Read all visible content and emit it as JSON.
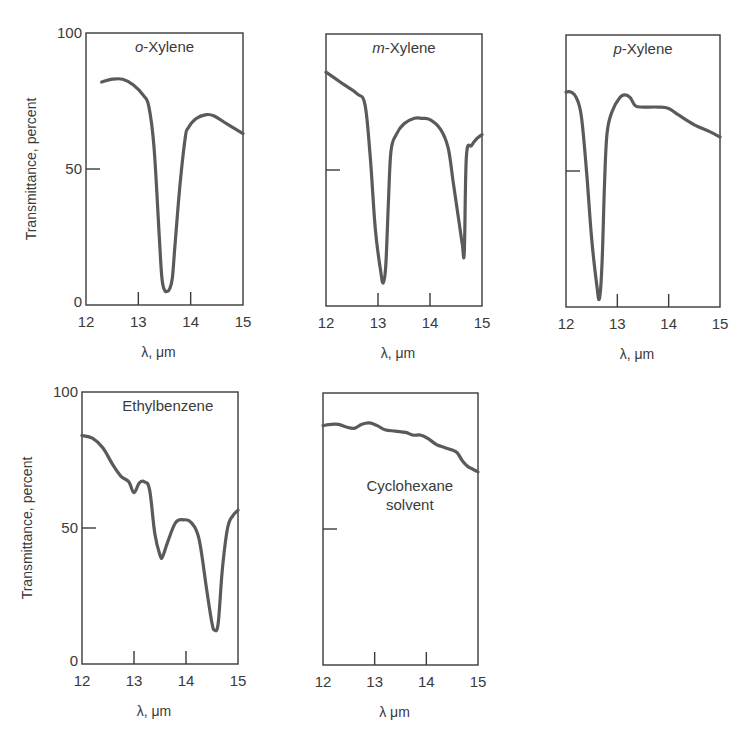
{
  "figure": {
    "background": "#ffffff",
    "ink_color": "#3a3a3a",
    "curve_color": "#5a5a5a"
  },
  "chart_data": [
    {
      "type": "line",
      "title": "o-Xylene",
      "title_italic_prefix": "o",
      "title_rest": "-Xylene",
      "xlabel": "λ, μm",
      "ylabel": "Transmittance, percent",
      "xlim": [
        12,
        15
      ],
      "ylim": [
        0,
        100
      ],
      "xticks": [
        12,
        13,
        14,
        15
      ],
      "yticks": [
        0,
        50,
        100
      ],
      "show_y_tick_labels": true,
      "grid": false,
      "box": {
        "x": 86,
        "y": 33,
        "w": 157,
        "h": 272
      },
      "title_pos": {
        "x": 0.5,
        "y": 0.07
      },
      "x": [
        12.3,
        12.5,
        12.7,
        12.9,
        13.1,
        13.2,
        13.3,
        13.4,
        13.45,
        13.5,
        13.55,
        13.6,
        13.65,
        13.7,
        13.8,
        13.9,
        13.95,
        14.1,
        14.3,
        14.45,
        14.7,
        15.0
      ],
      "y": [
        82,
        83,
        83,
        81,
        77,
        73,
        58,
        25,
        10,
        5.5,
        5,
        6,
        10,
        22,
        45,
        62,
        65,
        68.5,
        70,
        69.5,
        66.5,
        63
      ]
    },
    {
      "type": "line",
      "title": "m-Xylene",
      "title_italic_prefix": "m",
      "title_rest": "-Xylene",
      "xlabel": "λ, μm",
      "ylabel": "",
      "xlim": [
        12,
        15
      ],
      "ylim": [
        0,
        100
      ],
      "xticks": [
        12,
        13,
        14,
        15
      ],
      "yticks": [
        0,
        50,
        100
      ],
      "show_y_tick_labels": false,
      "grid": false,
      "box": {
        "x": 326,
        "y": 34,
        "w": 156,
        "h": 272
      },
      "title_pos": {
        "x": 0.5,
        "y": 0.07
      },
      "x": [
        12.0,
        12.3,
        12.6,
        12.75,
        12.85,
        12.95,
        13.05,
        13.1,
        13.15,
        13.2,
        13.25,
        13.35,
        13.5,
        13.7,
        13.85,
        14.0,
        14.2,
        14.35,
        14.45,
        14.55,
        14.62,
        14.66,
        14.7,
        14.8,
        14.9,
        15.0
      ],
      "y": [
        86,
        82,
        78,
        74,
        55,
        28,
        13,
        8.5,
        15,
        38,
        57,
        63,
        67,
        69,
        69,
        68.5,
        65,
        58,
        45,
        32,
        23,
        20,
        55,
        59,
        61.5,
        63
      ]
    },
    {
      "type": "line",
      "title": "p-Xylene",
      "title_italic_prefix": "p",
      "title_rest": "-Xylene",
      "xlabel": "λ, μm",
      "ylabel": "",
      "xlim": [
        12,
        15
      ],
      "ylim": [
        0,
        100
      ],
      "xticks": [
        12,
        13,
        14,
        15
      ],
      "yticks": [
        0,
        50,
        100
      ],
      "show_y_tick_labels": false,
      "grid": false,
      "box": {
        "x": 566,
        "y": 35,
        "w": 154,
        "h": 272
      },
      "title_pos": {
        "x": 0.5,
        "y": 0.07
      },
      "x": [
        12.0,
        12.1,
        12.2,
        12.3,
        12.4,
        12.5,
        12.6,
        12.65,
        12.7,
        12.75,
        12.8,
        12.9,
        13.05,
        13.15,
        13.25,
        13.35,
        13.5,
        13.8,
        14.0,
        14.2,
        14.5,
        14.8,
        15.0
      ],
      "y": [
        79,
        79,
        77,
        70,
        50,
        25,
        8,
        3,
        15,
        45,
        64,
        72,
        77,
        78,
        77,
        74,
        73.5,
        73.5,
        73,
        70.5,
        67,
        64.5,
        62.5
      ]
    },
    {
      "type": "line",
      "title": "Ethylbenzene",
      "title_italic_prefix": "",
      "title_rest": "Ethylbenzene",
      "xlabel": "λ, μm",
      "ylabel": "Transmittance, percent",
      "xlim": [
        12,
        15
      ],
      "ylim": [
        0,
        100
      ],
      "xticks": [
        12,
        13,
        14,
        15
      ],
      "yticks": [
        0,
        50,
        100
      ],
      "show_y_tick_labels": true,
      "grid": false,
      "box": {
        "x": 82,
        "y": 392,
        "w": 156,
        "h": 272
      },
      "title_pos": {
        "x": 0.55,
        "y": 0.07
      },
      "x": [
        12.0,
        12.2,
        12.4,
        12.6,
        12.75,
        12.9,
        13.0,
        13.1,
        13.2,
        13.3,
        13.4,
        13.5,
        13.55,
        13.65,
        13.8,
        13.95,
        14.1,
        14.25,
        14.4,
        14.5,
        14.55,
        14.62,
        14.7,
        14.8,
        14.9,
        15.0
      ],
      "y": [
        84,
        83,
        79.5,
        73,
        69,
        67,
        63,
        66.5,
        67,
        64,
        48,
        40,
        39.5,
        45,
        52,
        53,
        52,
        46,
        27,
        15,
        12.5,
        15,
        35,
        50,
        54.5,
        56.5
      ]
    },
    {
      "type": "line",
      "title": "Cyclohexane solvent",
      "title_lines": [
        "Cyclohexane",
        "solvent"
      ],
      "title_italic_prefix": "",
      "title_rest": "Cyclohexane solvent",
      "xlabel": "λ  μm",
      "ylabel": "",
      "xlim": [
        12,
        15
      ],
      "ylim": [
        0,
        100
      ],
      "xticks": [
        12,
        13,
        14,
        15
      ],
      "yticks": [
        0,
        50,
        100
      ],
      "show_y_tick_labels": false,
      "grid": false,
      "box": {
        "x": 323,
        "y": 393,
        "w": 155,
        "h": 272
      },
      "title_pos": {
        "x": 0.56,
        "y": 0.36
      },
      "x": [
        12.0,
        12.15,
        12.3,
        12.45,
        12.6,
        12.75,
        12.9,
        13.05,
        13.2,
        13.4,
        13.6,
        13.75,
        13.9,
        14.05,
        14.2,
        14.35,
        14.5,
        14.6,
        14.7,
        14.8,
        14.9,
        15.0
      ],
      "y": [
        88,
        88.5,
        88.5,
        87.5,
        87,
        88.5,
        89,
        88,
        86.5,
        86,
        85.5,
        84.5,
        84.5,
        83,
        81,
        80,
        79,
        78,
        75,
        73,
        72,
        71
      ]
    }
  ]
}
